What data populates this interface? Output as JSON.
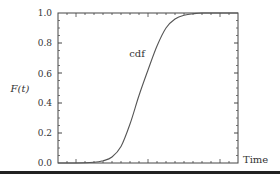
{
  "chart_data": {
    "type": "line",
    "title": "",
    "xlabel": "Time",
    "ylabel": "F(t)",
    "ylim": [
      0.0,
      1.0
    ],
    "yticks": [
      "0.0",
      "0.2",
      "0.4",
      "0.6",
      "0.8",
      "1.0"
    ],
    "xticks_labeled": false,
    "grid": false,
    "legend": null,
    "annotations": [
      {
        "text": "cdf",
        "near_y": 0.75
      }
    ],
    "series": [
      {
        "name": "cdf",
        "x": [
          0.0,
          0.1,
          0.2,
          0.25,
          0.3,
          0.35,
          0.4,
          0.45,
          0.5,
          0.55,
          0.6,
          0.65,
          0.7,
          0.75,
          0.8,
          0.9,
          1.0
        ],
        "values": [
          0.0,
          0.0,
          0.005,
          0.015,
          0.04,
          0.11,
          0.26,
          0.45,
          0.62,
          0.78,
          0.9,
          0.96,
          0.985,
          0.995,
          1.0,
          1.0,
          1.0
        ]
      }
    ]
  },
  "labels": {
    "ylabel": "F(t)",
    "xlabel": "Time",
    "curve": "cdf",
    "y0": "0.0",
    "y1": "0.2",
    "y2": "0.4",
    "y3": "0.6",
    "y4": "0.8",
    "y5": "1.0"
  },
  "colors": {
    "axis": "#444444",
    "curve": "#555555",
    "text": "#333333",
    "bottom_bar": "#222222"
  }
}
